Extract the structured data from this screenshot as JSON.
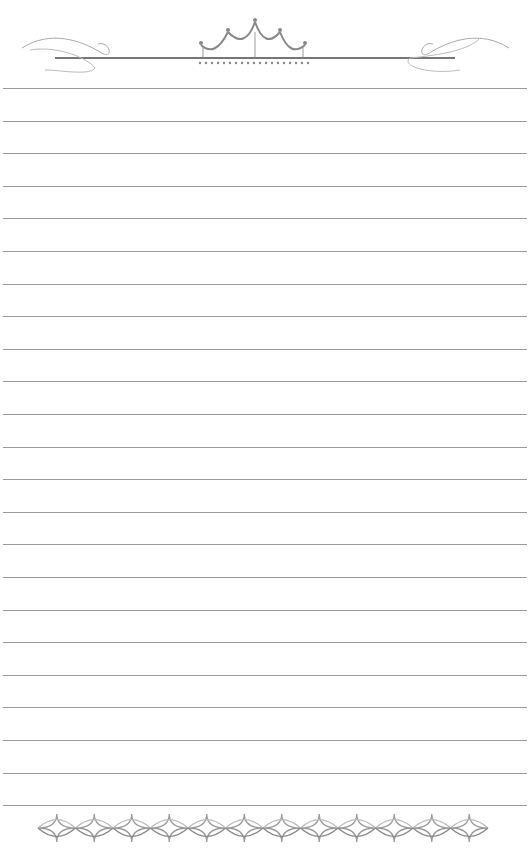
{
  "page": {
    "type": "lined stationery",
    "background": "#ffffff",
    "line_color": "#9a9a9a",
    "line_count": 23,
    "first_line_y": 88,
    "line_spacing": 32.6
  },
  "decorations": {
    "header": "crown-flourish-ornament",
    "footer": "diamond-chain-border",
    "footer_diamond_count": 12
  }
}
